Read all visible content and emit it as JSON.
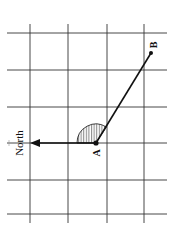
{
  "diagram": {
    "labels": {
      "north": "North",
      "point_a": "A",
      "point_b": "B"
    },
    "grid": {
      "vertical_x": [
        30,
        68,
        107,
        144
      ],
      "horizontal_y": [
        33,
        70,
        107,
        143,
        180,
        214
      ]
    },
    "points": {
      "A": {
        "x": 96,
        "y": 143
      },
      "B": {
        "x": 151,
        "y": 53
      }
    },
    "colors": {
      "line": "#111111",
      "grid": "#333333",
      "background": "#ffffff"
    }
  }
}
